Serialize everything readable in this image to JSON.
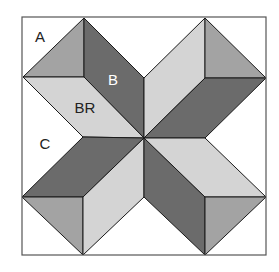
{
  "diagram": {
    "colors": {
      "background": "#ffffff",
      "border": "#555555",
      "outline": "#1a1a1a",
      "dark": "#6b6b6b",
      "medium": "#a3a3a3",
      "light": "#d4d4d4",
      "label_on_dark": "#ffffff",
      "label_on_light": "#222222"
    },
    "labels": {
      "a": "A",
      "b": "B",
      "br": "BR",
      "c": "C"
    },
    "border": {
      "x": 22,
      "y": 17,
      "width": 244,
      "height": 238
    },
    "center": {
      "x": 144,
      "y": 138
    },
    "pieces": [
      {
        "name": "tl-triangle-medium",
        "shade": "medium",
        "points": "23,77 84,18 84,77"
      },
      {
        "name": "tl-parallelogram-b-dark",
        "shade": "dark",
        "points": "84,18 144,78 144,138 84,77"
      },
      {
        "name": "tl-parallelogram-br-light",
        "shade": "light",
        "points": "23,77 84,77 144,138 83,137"
      },
      {
        "name": "tr-parallelogram-light",
        "shade": "light",
        "points": "205,18 205,78 144,138 144,78"
      },
      {
        "name": "tr-triangle-medium",
        "shade": "medium",
        "points": "205,18 266,78 205,78"
      },
      {
        "name": "tr-parallelogram-dark",
        "shade": "dark",
        "points": "205,78 266,78 205,138 144,138"
      },
      {
        "name": "bl-parallelogram-dark",
        "shade": "dark",
        "points": "83,137 144,138 83,197 22,197"
      },
      {
        "name": "bl-triangle-medium",
        "shade": "medium",
        "points": "22,197 83,197 83,255"
      },
      {
        "name": "bl-parallelogram-light",
        "shade": "light",
        "points": "83,197 144,138 144,197 83,255"
      },
      {
        "name": "br-parallelogram-dark",
        "shade": "dark",
        "points": "144,138 205,197 205,255 144,197"
      },
      {
        "name": "br-parallelogram-light",
        "shade": "light",
        "points": "144,138 205,138 266,197 205,197"
      },
      {
        "name": "br-triangle-medium",
        "shade": "medium",
        "points": "205,197 266,197 205,255"
      }
    ],
    "label_positions": {
      "a": {
        "x": 40,
        "y": 36
      },
      "b": {
        "x": 113,
        "y": 79
      },
      "br": {
        "x": 85,
        "y": 107
      },
      "c": {
        "x": 45,
        "y": 143
      }
    }
  }
}
